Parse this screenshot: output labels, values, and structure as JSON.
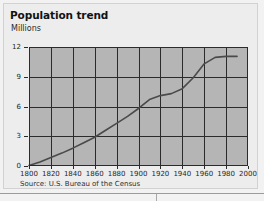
{
  "figure": {
    "title": "Population trend",
    "source": "Source: U.S. Bureau of the Census"
  },
  "chart_data": {
    "type": "line",
    "title": "Population trend",
    "subtitle": "",
    "xlabel": "",
    "ylabel": "Millions",
    "xlim": [
      1800,
      2000
    ],
    "ylim": [
      0,
      12
    ],
    "xticks": [
      1800,
      1820,
      1840,
      1860,
      1880,
      1900,
      1920,
      1940,
      1960,
      1980,
      2000
    ],
    "xtick_labels": [
      "1800",
      "1820",
      "1840",
      "1860",
      "1880",
      "1900",
      "1920",
      "1940",
      "1960",
      "1980",
      "2000"
    ],
    "yticks": [
      0,
      3,
      6,
      9,
      12
    ],
    "ytick_labels": [
      "0",
      "3",
      "6",
      "9",
      "12"
    ],
    "grid": true,
    "grid_axis": "both",
    "legend": false,
    "legend_position": "none",
    "plot_background": "#b5b5b5",
    "line_color": "#4a4a4a",
    "line_width": 1.6,
    "series": [
      {
        "name": "Population",
        "x": [
          1800,
          1810,
          1820,
          1830,
          1840,
          1850,
          1860,
          1870,
          1880,
          1890,
          1900,
          1910,
          1920,
          1930,
          1940,
          1950,
          1960,
          1970,
          1980,
          1990
        ],
        "values": [
          0.05,
          0.4,
          0.85,
          1.3,
          1.8,
          2.35,
          2.9,
          3.6,
          4.3,
          5.0,
          5.8,
          6.7,
          7.1,
          7.3,
          7.8,
          8.9,
          10.3,
          10.95,
          11.05,
          11.05
        ]
      }
    ]
  },
  "axis": {
    "y_title": "Millions"
  }
}
